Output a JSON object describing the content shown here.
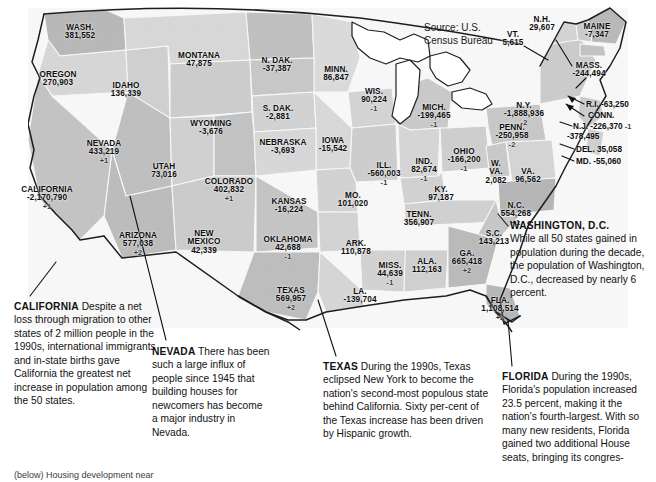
{
  "figure": {
    "source_note": "Source: U.S.\nCensus Bureau",
    "source_line1": "Source: U.S.",
    "source_line2": "Census Bureau",
    "footer_caption": "(below) Housing development near"
  },
  "states": [
    {
      "id": "wash",
      "name": "WASH.",
      "value": "381,552",
      "seats": "",
      "x": 80,
      "y": 24
    },
    {
      "id": "oregon",
      "name": "OREGON",
      "value": "270,903",
      "seats": "",
      "x": 58,
      "y": 71
    },
    {
      "id": "idaho",
      "name": "IDAHO",
      "value": "136,339",
      "seats": "",
      "x": 126,
      "y": 82
    },
    {
      "id": "montana",
      "name": "MONTANA",
      "value": "47,875",
      "seats": "",
      "x": 199,
      "y": 52
    },
    {
      "id": "ndak",
      "name": "N. DAK.",
      "value": "-37,387",
      "seats": "",
      "x": 277,
      "y": 57
    },
    {
      "id": "minn",
      "name": "MINN.",
      "value": "86,847",
      "seats": "",
      "x": 336,
      "y": 66
    },
    {
      "id": "wyoming",
      "name": "WYOMING",
      "value": "-3,676",
      "seats": "",
      "x": 211,
      "y": 120
    },
    {
      "id": "sdak",
      "name": "S. DAK.",
      "value": "-2,881",
      "seats": "",
      "x": 278,
      "y": 105
    },
    {
      "id": "wis",
      "name": "WIS.",
      "value": "90,224",
      "seats": "-1",
      "x": 374,
      "y": 88
    },
    {
      "id": "mich",
      "name": "MICH.",
      "value": "-199,465",
      "seats": "-1",
      "x": 434,
      "y": 104
    },
    {
      "id": "nevada",
      "name": "NEVADA",
      "value": "433,219",
      "seats": "+1",
      "x": 104,
      "y": 140
    },
    {
      "id": "utah",
      "name": "UTAH",
      "value": "73,016",
      "seats": "",
      "x": 164,
      "y": 163
    },
    {
      "id": "nebraska",
      "name": "NEBRASKA",
      "value": "-3,693",
      "seats": "",
      "x": 283,
      "y": 139
    },
    {
      "id": "iowa",
      "name": "IOWA",
      "value": "-15,542",
      "seats": "",
      "x": 333,
      "y": 137
    },
    {
      "id": "colorado",
      "name": "COLORADO",
      "value": "402,832",
      "seats": "+1",
      "x": 229,
      "y": 178
    },
    {
      "id": "ill",
      "name": "ILL.",
      "value": "-560,003",
      "seats": "-1",
      "x": 384,
      "y": 162
    },
    {
      "id": "ind",
      "name": "IND.",
      "value": "82,674",
      "seats": "-1",
      "x": 424,
      "y": 158
    },
    {
      "id": "ohio",
      "name": "OHIO",
      "value": "-166,200",
      "seats": "-1",
      "x": 464,
      "y": 148
    },
    {
      "id": "penn",
      "name": "PENN.",
      "value": "-250,958",
      "seats": "-2",
      "x": 512,
      "y": 124
    },
    {
      "id": "kansas",
      "name": "KANSAS",
      "value": "-16,224",
      "seats": "",
      "x": 289,
      "y": 198
    },
    {
      "id": "mo",
      "name": "MO.",
      "value": "101,020",
      "seats": "",
      "x": 353,
      "y": 192
    },
    {
      "id": "ky",
      "name": "KY.",
      "value": "97,187",
      "seats": "",
      "x": 441,
      "y": 186
    },
    {
      "id": "wva",
      "name": "W.\nVA.",
      "value": "2,082",
      "seats": "",
      "x": 496,
      "y": 160
    },
    {
      "id": "va",
      "name": "VA.",
      "value": "96,562",
      "seats": "",
      "x": 528,
      "y": 168
    },
    {
      "id": "nc",
      "name": "N.C.",
      "value": "554,268",
      "seats": "+1",
      "x": 516,
      "y": 202
    },
    {
      "id": "tenn",
      "name": "TENN.",
      "value": "356,907",
      "seats": "",
      "x": 419,
      "y": 211
    },
    {
      "id": "arizona",
      "name": "ARIZONA",
      "value": "577,038",
      "seats": "+2",
      "x": 138,
      "y": 232
    },
    {
      "id": "newmexico",
      "name": "NEW\nMEXICO",
      "value": "42,339",
      "seats": "",
      "x": 204,
      "y": 230
    },
    {
      "id": "oklahoma",
      "name": "OKLAHOMA",
      "value": "42,688",
      "seats": "-1",
      "x": 288,
      "y": 236
    },
    {
      "id": "ark",
      "name": "ARK.",
      "value": "110,878",
      "seats": "",
      "x": 356,
      "y": 240
    },
    {
      "id": "sc",
      "name": "S.C.",
      "value": "143,213",
      "seats": "",
      "x": 494,
      "y": 230
    },
    {
      "id": "miss",
      "name": "MISS.",
      "value": "44,639",
      "seats": "-1",
      "x": 390,
      "y": 262
    },
    {
      "id": "ala",
      "name": "ALA.",
      "value": "112,163",
      "seats": "",
      "x": 427,
      "y": 258
    },
    {
      "id": "ga",
      "name": "GA.",
      "value": "665,418",
      "seats": "+2",
      "x": 467,
      "y": 250
    },
    {
      "id": "texas",
      "name": "TEXAS",
      "value": "569,957",
      "seats": "+2",
      "x": 291,
      "y": 287
    },
    {
      "id": "la",
      "name": "LA.",
      "value": "-139,704",
      "seats": "",
      "x": 360,
      "y": 288
    },
    {
      "id": "fla",
      "name": "FLA.",
      "value": "1,108,514",
      "seats": "+2",
      "x": 500,
      "y": 297
    },
    {
      "id": "california",
      "name": "CALIFORNIA",
      "value": "-2,170,790",
      "seats": "+1",
      "x": 47,
      "y": 186
    }
  ],
  "new_england": [
    {
      "id": "vt",
      "name": "VT.",
      "value": "5,615",
      "seats": "",
      "x": 513,
      "y": 31
    },
    {
      "id": "nh",
      "name": "N.H.",
      "value": "29,607",
      "seats": "",
      "x": 542,
      "y": 16
    },
    {
      "id": "maine",
      "name": "MAINE",
      "value": "-7,347",
      "seats": "",
      "x": 597,
      "y": 23
    },
    {
      "id": "mass",
      "name": "MASS.",
      "value": "-244,494",
      "seats": "",
      "x": 589,
      "y": 62
    },
    {
      "id": "ny",
      "name": "N.Y.",
      "value": "-1,888,936",
      "seats": "-2",
      "x": 524,
      "y": 102
    }
  ],
  "coastal_flags": [
    {
      "id": "ri",
      "label": "R.I. -63,250",
      "seats": "",
      "x": 586,
      "y": 101
    },
    {
      "id": "conn",
      "label": "CONN.",
      "seats": "",
      "x": 588,
      "y": 112
    },
    {
      "id": "nj",
      "label": "N.J. -226,370",
      "seats": "-1",
      "x": 573,
      "y": 123
    },
    {
      "id": "conn-value",
      "label": "-378,495",
      "seats": "",
      "x": 567,
      "y": 133
    },
    {
      "id": "del",
      "label": "DEL. 35,058",
      "seats": "",
      "x": 576,
      "y": 146
    },
    {
      "id": "md",
      "label": "MD. -55,060",
      "seats": "",
      "x": 576,
      "y": 158
    }
  ],
  "callouts": [
    {
      "id": "california",
      "title": "CALIFORNIA",
      "body": " Despite a net loss through migration to other states of 2 million people in the 1990s, international immigrants and in-state births gave California the greatest net increase in population among the 50 states.",
      "x": 14,
      "y": 300,
      "w": 148
    },
    {
      "id": "nevada",
      "title": "NEVADA",
      "body": " There has been such a large influx of people since 1945 that building houses for newcomers has become a major industry in Nevada.",
      "x": 152,
      "y": 345,
      "w": 118
    },
    {
      "id": "texas",
      "title": "TEXAS",
      "body": " During the 1990s, Texas eclipsed New York to become the nation's second-most populous state behind California. Sixty per-cent of the Texas increase has been driven by Hispanic growth.",
      "x": 323,
      "y": 360,
      "w": 168
    },
    {
      "id": "florida",
      "title": "FLORIDA",
      "body": " During the 1990s, Florida's population increased 23.5 percent, making it the nation's fourth-largest. With so many new residents, Florida gained two additional House seats, bringing its congres-",
      "x": 502,
      "y": 370,
      "w": 142
    },
    {
      "id": "washington-dc",
      "title": "WASHINGTON, D.C.",
      "body": "While all 50 states gained in population during the decade, the population of Washington, D.C., decreased by nearly 6 percent.",
      "x": 510,
      "y": 219,
      "w": 140,
      "block": true
    }
  ],
  "chart_data": {
    "type": "map",
    "source": "U.S. Census Bureau",
    "unit": "people (net change); congressional seat change",
    "values": [
      {
        "state": "Washington",
        "change": 381552,
        "seats": 0
      },
      {
        "state": "Oregon",
        "change": 270903,
        "seats": 0
      },
      {
        "state": "Idaho",
        "change": 136339,
        "seats": 0
      },
      {
        "state": "Montana",
        "change": 47875,
        "seats": 0
      },
      {
        "state": "North Dakota",
        "change": -37387,
        "seats": 0
      },
      {
        "state": "Minnesota",
        "change": 86847,
        "seats": 0
      },
      {
        "state": "Wyoming",
        "change": -3676,
        "seats": 0
      },
      {
        "state": "South Dakota",
        "change": -2881,
        "seats": 0
      },
      {
        "state": "Wisconsin",
        "change": 90224,
        "seats": -1
      },
      {
        "state": "Michigan",
        "change": -199465,
        "seats": -1
      },
      {
        "state": "Nevada",
        "change": 433219,
        "seats": 1
      },
      {
        "state": "Utah",
        "change": 73016,
        "seats": 0
      },
      {
        "state": "Nebraska",
        "change": -3693,
        "seats": 0
      },
      {
        "state": "Iowa",
        "change": -15542,
        "seats": 0
      },
      {
        "state": "Colorado",
        "change": 402832,
        "seats": 1
      },
      {
        "state": "Illinois",
        "change": -560003,
        "seats": -1
      },
      {
        "state": "Indiana",
        "change": 82674,
        "seats": -1
      },
      {
        "state": "Ohio",
        "change": -166200,
        "seats": -1
      },
      {
        "state": "Pennsylvania",
        "change": -250958,
        "seats": -2
      },
      {
        "state": "Kansas",
        "change": -16224,
        "seats": 0
      },
      {
        "state": "Missouri",
        "change": 101020,
        "seats": 0
      },
      {
        "state": "Kentucky",
        "change": 97187,
        "seats": 0
      },
      {
        "state": "West Virginia",
        "change": 2082,
        "seats": 0
      },
      {
        "state": "Virginia",
        "change": 96562,
        "seats": 0
      },
      {
        "state": "North Carolina",
        "change": 554268,
        "seats": 1
      },
      {
        "state": "Tennessee",
        "change": 356907,
        "seats": 0
      },
      {
        "state": "Arizona",
        "change": 577038,
        "seats": 2
      },
      {
        "state": "New Mexico",
        "change": 42339,
        "seats": 0
      },
      {
        "state": "Oklahoma",
        "change": 42688,
        "seats": -1
      },
      {
        "state": "Arkansas",
        "change": 110878,
        "seats": 0
      },
      {
        "state": "South Carolina",
        "change": 143213,
        "seats": 0
      },
      {
        "state": "Mississippi",
        "change": 44639,
        "seats": -1
      },
      {
        "state": "Alabama",
        "change": 112163,
        "seats": 0
      },
      {
        "state": "Georgia",
        "change": 665418,
        "seats": 2
      },
      {
        "state": "Texas",
        "change": 569957,
        "seats": 2
      },
      {
        "state": "Louisiana",
        "change": -139704,
        "seats": 0
      },
      {
        "state": "Florida",
        "change": 1108514,
        "seats": 2
      },
      {
        "state": "California",
        "change": -2170790,
        "seats": 1
      },
      {
        "state": "Vermont",
        "change": 5615,
        "seats": 0
      },
      {
        "state": "New Hampshire",
        "change": 29607,
        "seats": 0
      },
      {
        "state": "Maine",
        "change": -7347,
        "seats": 0
      },
      {
        "state": "Massachusetts",
        "change": -244494,
        "seats": 0
      },
      {
        "state": "New York",
        "change": -1888936,
        "seats": -2
      },
      {
        "state": "Rhode Island",
        "change": -63250,
        "seats": 0
      },
      {
        "state": "Connecticut",
        "change": -378495,
        "seats": 0
      },
      {
        "state": "New Jersey",
        "change": -226370,
        "seats": -1
      },
      {
        "state": "Delaware",
        "change": 35058,
        "seats": 0
      },
      {
        "state": "Maryland",
        "change": -55060,
        "seats": 0
      }
    ]
  }
}
